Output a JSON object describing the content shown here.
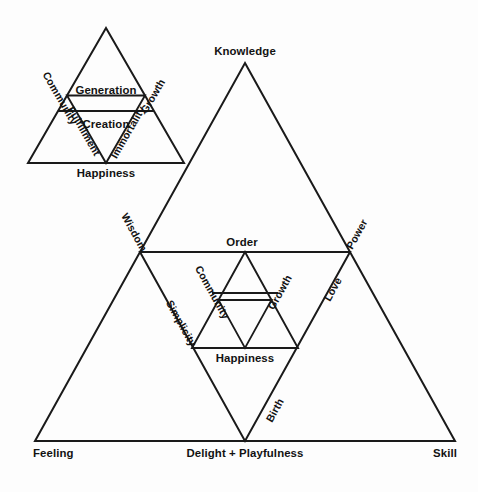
{
  "figure": {
    "background_color": "#fdfdfd",
    "line_color": "#1a1a1a",
    "text_color": "#121212"
  },
  "upper_triangle": {
    "name": "upper-left-triangle",
    "apex_label": "",
    "left_edge_label": "Community",
    "right_edge_label": "Growth",
    "base_label": "Happiness",
    "inner_top_label": "Generation",
    "inner_center_label": "Creation",
    "inner_left_label": "Fulfillment",
    "inner_right_label": "Immortality"
  },
  "lower_triangle": {
    "name": "main-large-triangle",
    "apex_label": "Knowledge",
    "left_corner_label": "Feeling",
    "bottom_center_label": "Delight + Playfulness",
    "right_corner_label": "Skill",
    "left_edge_label": "Wisdom",
    "right_edge_label": "Power",
    "inverted_top_label": "Order",
    "inverted_left_label": "Simplicity",
    "inverted_right_label": "Love",
    "inverted_bottom_label": "Birth",
    "inner_left_label": "Community",
    "inner_right_label": "Growth",
    "inner_base_label": "Happiness"
  }
}
